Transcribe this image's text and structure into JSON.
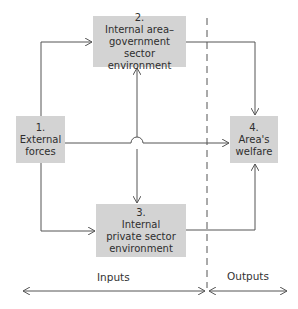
{
  "diagram": {
    "boxes": {
      "external_forces": {
        "number": "1.",
        "line1": "External",
        "line2": "forces"
      },
      "government": {
        "number": "2.",
        "line1": "Internal area–",
        "line2": "government sector",
        "line3": "environment"
      },
      "private": {
        "number": "3.",
        "line1": "Internal",
        "line2": "private sector",
        "line3": "environment"
      },
      "welfare": {
        "number": "4.",
        "line1": "Area's",
        "line2": "welfare"
      }
    },
    "regions": {
      "inputs_label": "Inputs",
      "outputs_label": "Outputs"
    },
    "edges": [
      {
        "from": "1. External forces",
        "to": "2. Internal area-government sector environment"
      },
      {
        "from": "1. External forces",
        "to": "3. Internal private sector environment"
      },
      {
        "from": "1. External forces",
        "to": "4. Area's welfare"
      },
      {
        "from": "3. Internal private sector environment",
        "to": "2. Internal area-government sector environment"
      },
      {
        "from": "2. Internal area-government sector environment",
        "to": "3. Internal private sector environment"
      },
      {
        "from": "2. Internal area-government sector environment",
        "to": "4. Area's welfare"
      },
      {
        "from": "3. Internal private sector environment",
        "to": "4. Area's welfare"
      }
    ],
    "colors": {
      "box_fill": "#d3d3d3",
      "line": "#555555",
      "text": "#2e2e2e"
    }
  }
}
